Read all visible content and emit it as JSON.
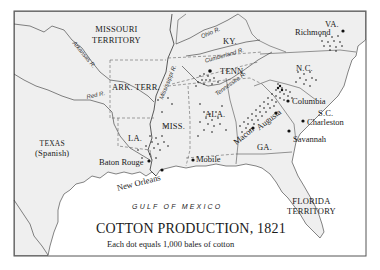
{
  "title": "COTTON PRODUCTION, 1821",
  "subtitle": "Each dot equals 1,000 bales of cotton",
  "water_label": "GULF OF MEXICO",
  "regions": {
    "missouri": [
      "MISSOURI",
      "TERRITORY"
    ],
    "va": "VA.",
    "ky": "KY.",
    "tenn": "TENN.",
    "nc": "N.C.",
    "sc": "S.C.",
    "ark": "ARK. TERR.",
    "miss": "MISS.",
    "ala": "ALA.",
    "la": "LA.",
    "ga": "GA.",
    "texas": [
      "TEXAS",
      "(Spanish)"
    ],
    "florida": [
      "FLORIDA",
      "TERRITORY"
    ]
  },
  "cities": {
    "richmond": "Richmond",
    "columbia": "Columbia",
    "charleston": "Charleston",
    "savannah": "Savannah",
    "augusta": "Augusta",
    "macon": "Macon",
    "mobile": "Mobile",
    "baton_rouge": "Baton Rouge",
    "new_orleans": "New Orleans"
  },
  "rivers": {
    "arkansas": "Arkansas R.",
    "red": "Red R.",
    "mississippi": "Mississippi R.",
    "ohio": "Ohio R.",
    "cumberland": "Cumberland R.",
    "tennessee": "Tennessee R."
  },
  "colors": {
    "land": "#efefef",
    "water": "#ffffff",
    "ink": "#1a1a1a",
    "frame": "#555555"
  }
}
